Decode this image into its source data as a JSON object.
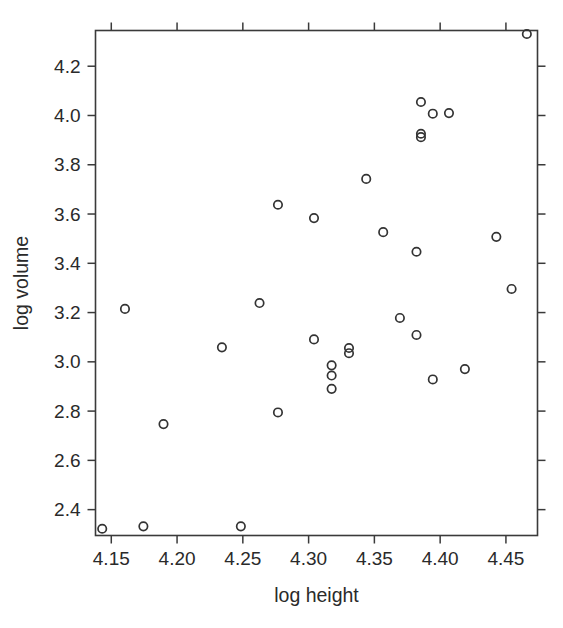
{
  "chart_data": {
    "type": "scatter",
    "title": "",
    "xlabel": "log height",
    "ylabel": "log volume",
    "xlim": [
      4.138,
      4.474
    ],
    "ylim": [
      2.295,
      4.345
    ],
    "xticks": [
      4.15,
      4.2,
      4.25,
      4.3,
      4.35,
      4.4,
      4.45
    ],
    "xticklabels": [
      "4.15",
      "4.20",
      "4.25",
      "4.30",
      "4.35",
      "4.40",
      "4.45"
    ],
    "yticks": [
      2.4,
      2.6,
      2.8,
      3.0,
      3.2,
      3.4,
      3.6,
      3.8,
      4.0,
      4.2
    ],
    "yticklabels": [
      "2.4",
      "2.6",
      "2.8",
      "3.0",
      "3.2",
      "3.4",
      "3.6",
      "3.8",
      "4.0",
      "4.2"
    ],
    "grid": false,
    "legend": null,
    "marker": {
      "shape": "open-circle",
      "radius": 4.2,
      "stroke_color": "#333333",
      "stroke_width": 1.7,
      "fill": "none"
    },
    "frame": {
      "box": true,
      "tick_direction": "outward",
      "color": "#3a3a3a"
    },
    "n_points": 31,
    "points": [
      {
        "x": 4.1431,
        "y": 2.3224
      },
      {
        "x": 4.1744,
        "y": 2.3321
      },
      {
        "x": 4.1604,
        "y": 3.2148
      },
      {
        "x": 4.1897,
        "y": 2.7473
      },
      {
        "x": 4.2341,
        "y": 3.0587
      },
      {
        "x": 4.2485,
        "y": 2.3321
      },
      {
        "x": 4.2627,
        "y": 3.2387
      },
      {
        "x": 4.2767,
        "y": 3.6376
      },
      {
        "x": 4.2767,
        "y": 2.7946
      },
      {
        "x": 4.3041,
        "y": 3.5835
      },
      {
        "x": 4.3041,
        "y": 3.091
      },
      {
        "x": 4.3175,
        "y": 2.9857
      },
      {
        "x": 4.3175,
        "y": 2.9444
      },
      {
        "x": 4.3175,
        "y": 2.8904
      },
      {
        "x": 4.3307,
        "y": 3.0562
      },
      {
        "x": 4.3307,
        "y": 3.035
      },
      {
        "x": 4.3438,
        "y": 3.7426
      },
      {
        "x": 4.3567,
        "y": 3.5264
      },
      {
        "x": 4.3694,
        "y": 3.1781
      },
      {
        "x": 4.382,
        "y": 3.4468
      },
      {
        "x": 4.382,
        "y": 3.1091
      },
      {
        "x": 4.3854,
        "y": 4.0547
      },
      {
        "x": 4.3854,
        "y": 3.9259
      },
      {
        "x": 4.3854,
        "y": 3.912
      },
      {
        "x": 4.3944,
        "y": 4.0073
      },
      {
        "x": 4.3944,
        "y": 2.9285
      },
      {
        "x": 4.4067,
        "y": 4.0097
      },
      {
        "x": 4.4188,
        "y": 2.9704
      },
      {
        "x": 4.4427,
        "y": 3.5073
      },
      {
        "x": 4.4543,
        "y": 3.2958
      },
      {
        "x": 4.4659,
        "y": 4.3307
      }
    ]
  }
}
